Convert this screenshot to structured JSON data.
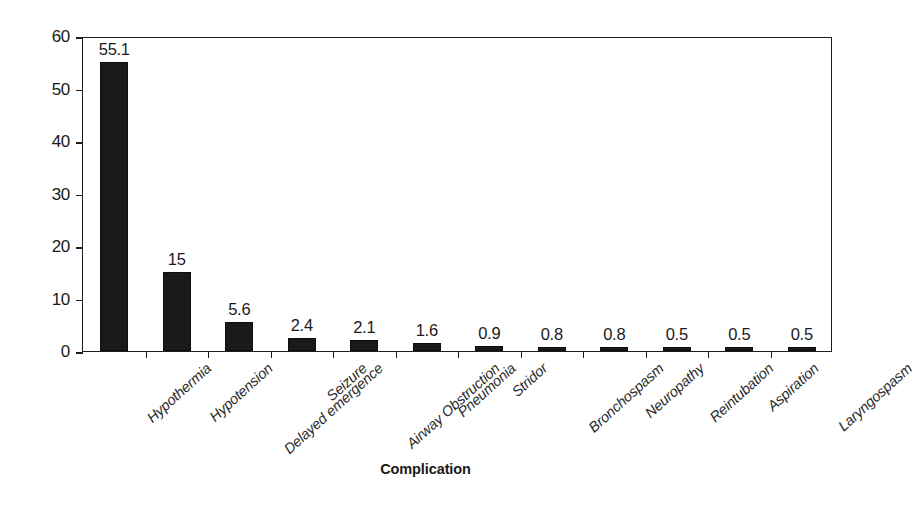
{
  "chart_data": {
    "type": "bar",
    "title": "",
    "xlabel": "Complication",
    "ylabel": "Percentage of patients",
    "ylim": [
      0,
      60
    ],
    "yticks": [
      0,
      10,
      20,
      30,
      40,
      50,
      60
    ],
    "grid": false,
    "legend": null,
    "bar_color": "#1a1a1a",
    "categories": [
      "Hypothermia",
      "Hypotension",
      "Delayed emergence",
      "Seizure",
      "Airway Obstruction",
      "Pneumonia",
      "Stridor",
      "Bronchospasm",
      "Neuropathy",
      "Reintubation",
      "Aspiration",
      "Laryngospasm"
    ],
    "values": [
      55.1,
      15,
      5.6,
      2.4,
      2.1,
      1.6,
      0.9,
      0.8,
      0.8,
      0.5,
      0.5,
      0.5
    ],
    "value_labels": [
      "55.1",
      "15",
      "5.6",
      "2.4",
      "2.1",
      "1.6",
      "0.9",
      "0.8",
      "0.8",
      "0.5",
      "0.5",
      "0.5"
    ],
    "ytick_labels": [
      "0",
      "10",
      "20",
      "30",
      "40",
      "50",
      "60"
    ]
  }
}
